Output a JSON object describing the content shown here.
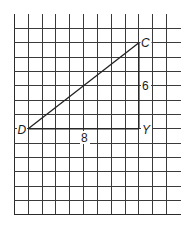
{
  "diagram": {
    "type": "right-triangle-on-grid",
    "grid": {
      "columns": 12,
      "rows": 13,
      "origin_x": 14.3,
      "origin_y": 14.0,
      "first_h_line_y": 28.3,
      "col_spacing": 13.85,
      "row_spacing": 14.35,
      "right_edge_x": 180.5,
      "bottom_edge_y": 214.5,
      "line_color": "#3a3a3a"
    },
    "triangle": {
      "vertices": [
        {
          "name": "D",
          "x": 28.2,
          "y": 128.8,
          "grid_col": 1,
          "grid_row": 7
        },
        {
          "name": "Y",
          "x": 138.9,
          "y": 128.8,
          "grid_col": 9,
          "grid_row": 7
        },
        {
          "name": "C",
          "x": 138.9,
          "y": 42.7,
          "grid_col": 9,
          "grid_row": 1
        }
      ],
      "edges": [
        {
          "from": "D",
          "to": "Y",
          "length_label": "8"
        },
        {
          "from": "Y",
          "to": "C",
          "length_label": "6"
        },
        {
          "from": "D",
          "to": "C",
          "length_label": ""
        }
      ],
      "edge_color": "#222222"
    },
    "labels": {
      "vertex_d": "D",
      "vertex_y": "Y",
      "vertex_c": "C",
      "side_dy": "8",
      "side_yc": "6"
    }
  }
}
